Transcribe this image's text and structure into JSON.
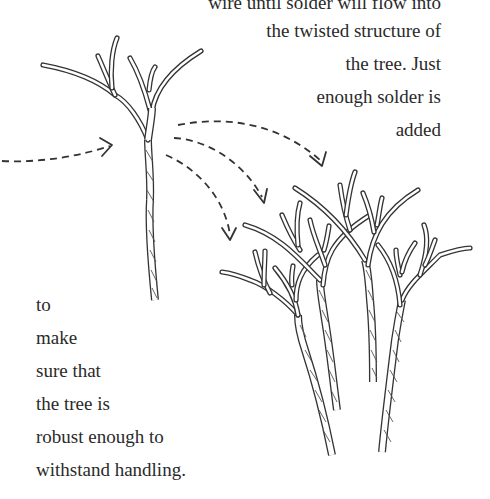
{
  "text_right": {
    "lines": [
      "wire until solder will flow into",
      "the twisted structure of",
      "the tree. Just",
      "enough solder is",
      "added"
    ]
  },
  "text_left": {
    "lines": [
      "to",
      "make",
      "sure that",
      "the tree is",
      "robust enough to",
      "withstand handling."
    ]
  },
  "illustration": {
    "single_tree": "twisted-wire-tree",
    "arrows": [
      "incoming-arrow",
      "arrow-to-tree-1",
      "arrow-to-tree-2",
      "arrow-to-tree-3"
    ],
    "tree_group": [
      "wire-tree-1",
      "wire-tree-2",
      "wire-tree-3",
      "wire-tree-4"
    ]
  }
}
